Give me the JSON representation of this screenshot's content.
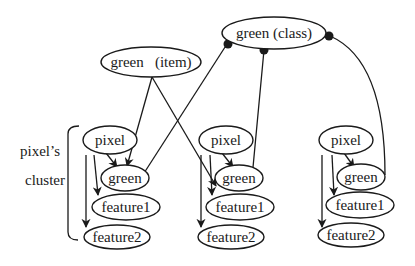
{
  "diagram": {
    "top_nodes": {
      "class_label": "green (class)",
      "item_label": "green   (item)"
    },
    "cluster_label_line1": "pixel’s",
    "cluster_label_line2": "cluster",
    "clusters": [
      {
        "pixel": "pixel",
        "green": "green",
        "feature1": "feature1",
        "feature2": "feature2"
      },
      {
        "pixel": "pixel",
        "green": "green",
        "feature1": "feature1",
        "feature2": "feature2"
      },
      {
        "pixel": "pixel",
        "green": "green",
        "feature1": "feature1",
        "feature2": "feature2"
      }
    ],
    "colors": {
      "stroke": "#1a1a1a",
      "background": "#ffffff"
    }
  }
}
